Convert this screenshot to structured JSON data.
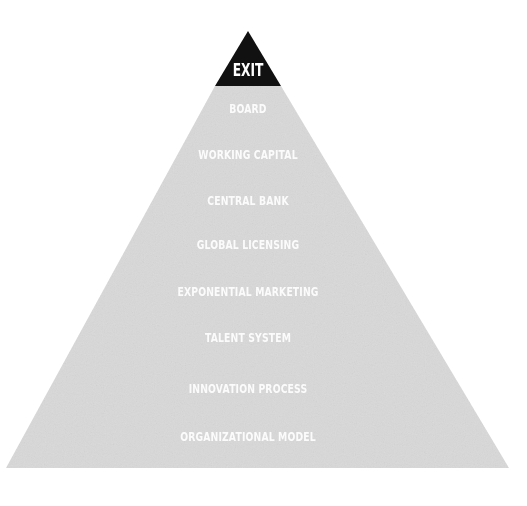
{
  "diagram": {
    "type": "pyramid",
    "colors": {
      "apex_fill": "#111111",
      "body_fill": "#d9d9d9",
      "label_text": "#ffffff",
      "background": "#ffffff"
    },
    "apex": {
      "label": "EXIT"
    },
    "tiers": [
      {
        "label": "BOARD"
      },
      {
        "label": "WORKING CAPITAL"
      },
      {
        "label": "CENTRAL BANK"
      },
      {
        "label": "GLOBAL LICENSING"
      },
      {
        "label": "EXPONENTIAL MARKETING"
      },
      {
        "label": "TALENT SYSTEM"
      },
      {
        "label": "INNOVATION PROCESS"
      },
      {
        "label": "ORGANIZATIONAL MODEL"
      }
    ]
  }
}
